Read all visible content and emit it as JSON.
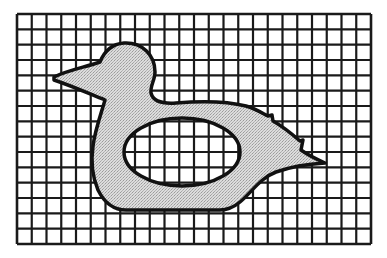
{
  "figure": {
    "grid": {
      "columns": 24,
      "rows": 15,
      "line_color": "#1a1a1a"
    },
    "shape": {
      "fill_color": "#d6d6d6",
      "outline_color": "#111111",
      "hole": "ellipse"
    }
  }
}
